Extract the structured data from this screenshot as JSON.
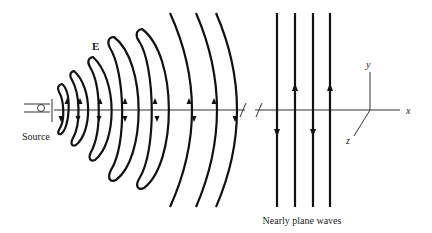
{
  "figure": {
    "labels": {
      "source": "Source",
      "field": "E",
      "caption": "Nearly plane waves",
      "axis_x": "x",
      "axis_y": "y",
      "axis_z": "z"
    },
    "colors": {
      "stroke": "#111111",
      "axis": "#333333",
      "background": "#ffffff"
    },
    "elements": {
      "near_field_loops": 5,
      "far_field_arcs": 3,
      "plane_wave_lines": 4,
      "plane_wave_arrow_directions": [
        "down",
        "up",
        "down",
        "up"
      ]
    }
  }
}
